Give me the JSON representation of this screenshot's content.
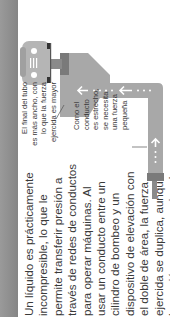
{
  "body_paragraph": {
    "lines": [
      "Un líquido es prácticamente",
      "incompresible, lo que le",
      "permite transferir presión a",
      "través de redes de conductos",
      "para operar máquinas. Al",
      "usar un conducto entre un",
      "cilindro de bombeo y un",
      "dispositivo de elevación con",
      "el doble de área, la fuerza",
      "ejercida se duplica, aunque",
      "la presión permanece igual."
    ]
  },
  "diagram": {
    "caption_wide_end": {
      "lines": [
        "El final del tubo",
        "es más ancho, con",
        "lo que la fuerza",
        "ejercida es mayor"
      ]
    },
    "caption_narrow_pipe": {
      "lines": [
        "Como el",
        "conducto",
        "es estrecho,",
        "se necesita",
        "una fuerza",
        "pequeña"
      ]
    },
    "icons": [
      "car-icon",
      "hydraulic-pipe",
      "flow-arrow-left",
      "flow-arrow-up",
      "flow-arrow-right",
      "pump-piston",
      "lift-piston"
    ]
  },
  "colors": {
    "strip": "#8c8c8c",
    "pipe_light": "#a8a8a8",
    "pipe_dark": "#7a7a7a",
    "car": "#b5b5b5",
    "text": "#3a3a3a"
  }
}
